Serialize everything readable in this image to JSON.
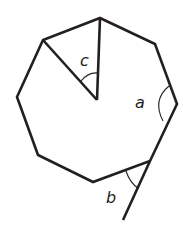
{
  "diagram": {
    "type": "regular-octagon-angles",
    "shape": "octagon",
    "vertices": [
      [
        100,
        18
      ],
      [
        155,
        44
      ],
      [
        177,
        104
      ],
      [
        150,
        161
      ],
      [
        93,
        182
      ],
      [
        38,
        155
      ],
      [
        17,
        97
      ],
      [
        43,
        40
      ]
    ],
    "center": [
      97,
      100
    ],
    "extension_end": [
      123,
      220
    ],
    "labels": {
      "a": "a",
      "b": "b",
      "c": "c"
    },
    "angles": [
      {
        "label": "a",
        "kind": "interior angle"
      },
      {
        "label": "b",
        "kind": "exterior angle"
      },
      {
        "label": "c",
        "kind": "central angle"
      }
    ],
    "colors": {
      "stroke": "#231f20",
      "background": "#ffffff"
    }
  }
}
